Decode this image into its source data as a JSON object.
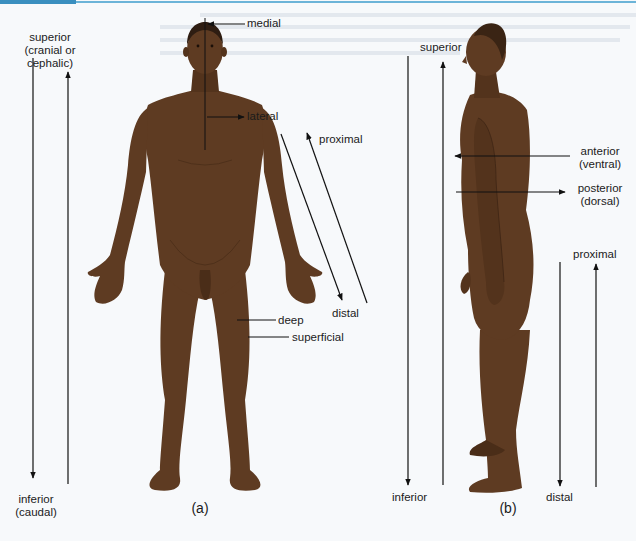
{
  "colors": {
    "skin": "#5e3b22",
    "skin_shadow": "#4a2d18",
    "hair": "#2e1d12",
    "arrow": "#111111",
    "page_bg": "#f7f9fb",
    "accent_bar": "#3a8fbf"
  },
  "figure_a": {
    "caption": "(a)",
    "labels": {
      "superior_line1": "superior",
      "superior_line2": "(cranial or",
      "superior_line3": "cephalic)",
      "inferior_line1": "inferior",
      "inferior_line2": "(caudal)",
      "medial": "medial",
      "lateral": "lateral",
      "proximal": "proximal",
      "distal": "distal",
      "deep": "deep",
      "superficial": "superficial"
    }
  },
  "figure_b": {
    "caption": "(b)",
    "labels": {
      "superior": "superior",
      "inferior": "inferior",
      "anterior_line1": "anterior",
      "anterior_line2": "(ventral)",
      "posterior_line1": "posterior",
      "posterior_line2": "(dorsal)",
      "proximal": "proximal",
      "distal": "distal"
    }
  }
}
